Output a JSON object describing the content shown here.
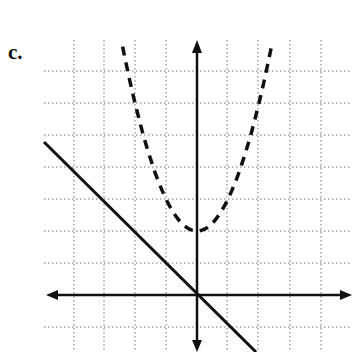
{
  "problem_label": "c.",
  "chart_data": {
    "type": "line",
    "title": "c.",
    "xlabel": "",
    "ylabel": "",
    "grid": true,
    "xlim": [
      -5,
      5
    ],
    "ylim": [
      -2,
      8
    ],
    "series": [
      {
        "name": "solid line",
        "style": "solid",
        "equation": "y = -x",
        "points": [
          [
            -4.8,
            4.8
          ],
          [
            1.8,
            -1.8
          ]
        ]
      },
      {
        "name": "dashed parabola",
        "style": "dashed",
        "equation": "y = x^2 + 2",
        "vertex": [
          0,
          2
        ],
        "points": [
          [
            -2.3,
            7.3
          ],
          [
            -2,
            6
          ],
          [
            -1,
            3
          ],
          [
            0,
            2
          ],
          [
            1,
            3
          ],
          [
            2,
            6
          ],
          [
            2.3,
            7.3
          ]
        ]
      }
    ]
  },
  "colors": {
    "axis": "#111111",
    "grid": "#777777",
    "curve": "#111111"
  }
}
